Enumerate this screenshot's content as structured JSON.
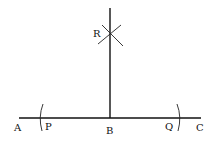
{
  "diagram": {
    "stroke_color": "#111111",
    "background": "#ffffff",
    "points": {
      "A": {
        "label": "A"
      },
      "P": {
        "label": "P"
      },
      "B": {
        "label": "B"
      },
      "Q": {
        "label": "Q"
      },
      "C": {
        "label": "C"
      },
      "R": {
        "label": "R"
      }
    },
    "elements": [
      {
        "type": "line",
        "name": "AC",
        "from": "A",
        "to": "C"
      },
      {
        "type": "line",
        "name": "BR",
        "from": "B",
        "to": "R",
        "extends_beyond": "R"
      },
      {
        "type": "arc",
        "name": "arc-at-P",
        "center": "B"
      },
      {
        "type": "arc",
        "name": "arc-at-Q",
        "center": "B"
      },
      {
        "type": "arc-intersection",
        "name": "arcs-at-R",
        "from": [
          "P",
          "Q"
        ]
      }
    ]
  }
}
